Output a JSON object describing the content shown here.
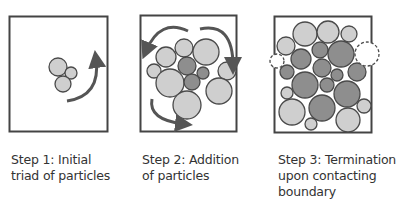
{
  "colors": {
    "light_particle": "#cfcfcf",
    "dark_particle": "#8e8e8e",
    "outline": "#4a4a4a",
    "box": "#444444",
    "arrow": "#555555",
    "text": "#333333"
  },
  "steps": [
    {
      "caption_lines": [
        "Step 1: Initial",
        "triad of particles"
      ]
    },
    {
      "caption_lines": [
        "Step 2: Addition",
        "of particles"
      ]
    },
    {
      "caption_lines": [
        "Step 3: Termination",
        "upon contacting",
        "boundary"
      ]
    }
  ]
}
